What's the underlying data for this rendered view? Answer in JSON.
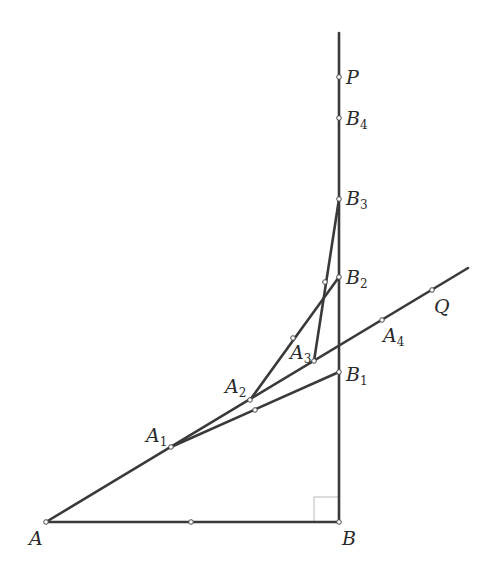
{
  "figure": {
    "type": "geometry-construction",
    "stroke_color": "#3a3a3a",
    "background": "#ffffff",
    "points": {
      "A": {
        "label": "A",
        "sub": "",
        "x": 46,
        "y": 522
      },
      "B": {
        "label": "B",
        "sub": "",
        "x": 339,
        "y": 522
      },
      "P": {
        "label": "P",
        "sub": "",
        "x": 339,
        "y": 77
      },
      "B4": {
        "label": "B",
        "sub": "4",
        "x": 339,
        "y": 118
      },
      "B3": {
        "label": "B",
        "sub": "3",
        "x": 339,
        "y": 199
      },
      "B2": {
        "label": "B",
        "sub": "2",
        "x": 339,
        "y": 277
      },
      "B1": {
        "label": "B",
        "sub": "1",
        "x": 339,
        "y": 372
      },
      "A1": {
        "label": "A",
        "sub": "1",
        "x": 171,
        "y": 447
      },
      "A2": {
        "label": "A",
        "sub": "2",
        "x": 250,
        "y": 400
      },
      "A3": {
        "label": "A",
        "sub": "3",
        "x": 314,
        "y": 361
      },
      "A4": {
        "label": "A",
        "sub": "4",
        "x": 382,
        "y": 320
      },
      "Q": {
        "label": "Q",
        "sub": "",
        "x": 432,
        "y": 290
      }
    },
    "segments": [
      {
        "name": "AB",
        "from": "A",
        "to": "B"
      },
      {
        "name": "ray-BP",
        "from": "B",
        "to_xy": [
          339,
          33
        ]
      },
      {
        "name": "ray-AQ",
        "from": "A",
        "to_xy": [
          468,
          268
        ]
      },
      {
        "name": "A1B1",
        "from": "A1",
        "to": "B1"
      },
      {
        "name": "A2B2",
        "from": "A2",
        "to": "B2"
      },
      {
        "name": "A3B3",
        "from": "A3",
        "to": "B3"
      }
    ],
    "midpoints": [
      {
        "name": "mid-AB",
        "x": 191,
        "y": 522
      },
      {
        "name": "mid-A1B1",
        "x": 255,
        "y": 410
      },
      {
        "name": "mid-A2B2",
        "x": 293,
        "y": 338
      },
      {
        "name": "mid-A3B3",
        "x": 325,
        "y": 282
      }
    ],
    "right_angle_mark": {
      "at": "B",
      "size": 25
    }
  }
}
